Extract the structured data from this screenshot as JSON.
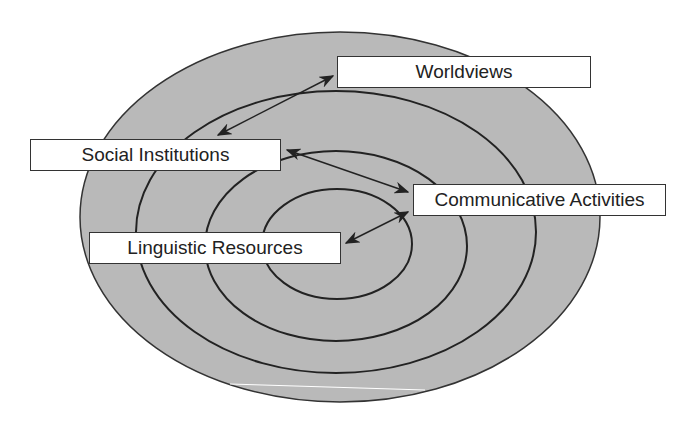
{
  "diagram": {
    "type": "concentric-ellipses",
    "fill_color": "#b9b9b9",
    "line_color": "#222222",
    "labels": {
      "worldviews": "Worldviews",
      "social_institutions": "Social Institutions",
      "communicative_activities": "Communicative Activities",
      "linguistic_resources": "Linguistic Resources"
    },
    "layers_outer_to_inner": [
      "Worldviews",
      "Social Institutions",
      "Communicative Activities",
      "Linguistic Resources"
    ],
    "connections": [
      {
        "from": "Worldviews",
        "to": "Social Institutions",
        "type": "bidirectional"
      },
      {
        "from": "Social Institutions",
        "to": "Communicative Activities",
        "type": "bidirectional"
      },
      {
        "from": "Communicative Activities",
        "to": "Linguistic Resources",
        "type": "bidirectional"
      }
    ]
  }
}
